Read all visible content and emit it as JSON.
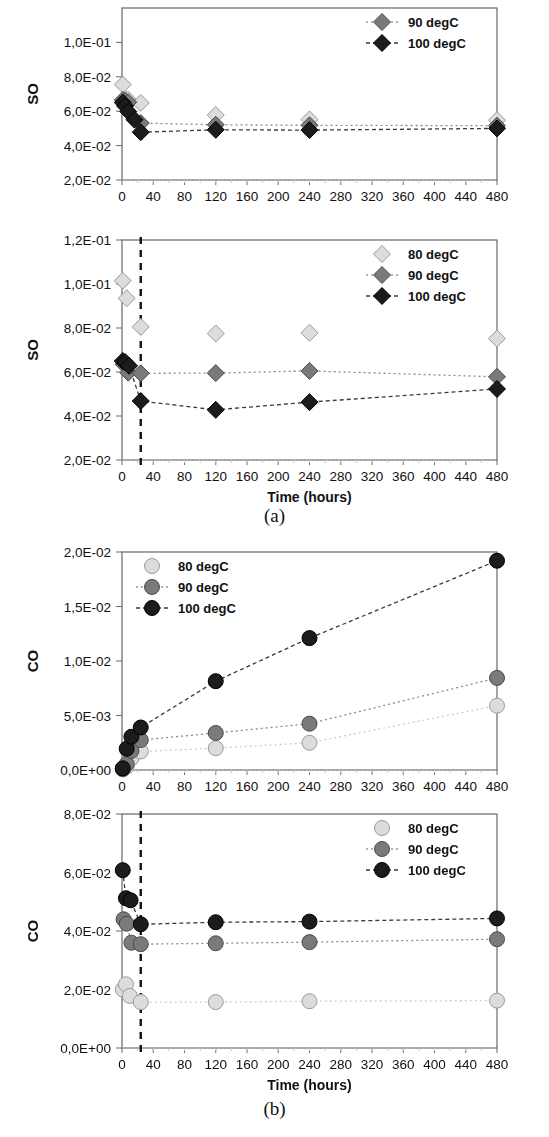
{
  "figure": {
    "captions": [
      {
        "id": "caption-a",
        "text": "(a)"
      },
      {
        "id": "caption-b",
        "text": "(b)"
      }
    ]
  },
  "legend_entries": [
    {
      "label": "80 degC",
      "marker": "light",
      "color": "#d9d9d9",
      "line": "none"
    },
    {
      "label": "90 degC",
      "marker": "mid",
      "color": "#7f7f7f",
      "line": "dotted"
    },
    {
      "label": "100 degC",
      "marker": "dark",
      "color": "#1a1a1a",
      "line": "dashed"
    }
  ],
  "axis": {
    "x_title": "Time (hours)",
    "x_ticks": [
      0,
      40,
      80,
      120,
      160,
      200,
      240,
      280,
      320,
      360,
      400,
      440,
      480
    ],
    "x_min": 0,
    "x_max": 480
  },
  "chart_data": [
    {
      "id": "chart-so-top",
      "type": "scatter",
      "title": "",
      "ylabel": "SO",
      "xlabel": "",
      "marker_shape": "diamond",
      "ylim": [
        0.02,
        0.12
      ],
      "ytick_values": [
        0.02,
        0.04,
        0.06,
        0.08,
        0.1
      ],
      "ytick_labels": [
        "2,0E-02",
        "4,0E-02",
        "6,0E-02",
        "8,0E-02",
        "1,0E-01"
      ],
      "ytop_label_clipped": true,
      "xlim": [
        0,
        480
      ],
      "xtick_labels": [
        "0",
        "40",
        "80",
        "120",
        "160",
        "200",
        "240",
        "280",
        "320",
        "360",
        "400",
        "440",
        "480"
      ],
      "grid": false,
      "legend_position": "top-right",
      "legend_visible": [
        "90 degC",
        "100 degC"
      ],
      "vline": null,
      "series": [
        {
          "name": "80 degC",
          "marker": "light",
          "line": "none",
          "x": [
            1,
            4,
            8,
            24,
            120,
            240,
            480
          ],
          "y": [
            0.0755,
            0.0672,
            0.0667,
            0.0648,
            0.0578,
            0.0552,
            0.0548
          ]
        },
        {
          "name": "90 degC",
          "marker": "mid",
          "line": "dotted",
          "x": [
            1,
            4,
            8,
            24,
            120,
            240,
            480
          ],
          "y": [
            0.0665,
            0.066,
            0.0652,
            0.0531,
            0.0521,
            0.0518,
            0.0516
          ]
        },
        {
          "name": "100 degC",
          "marker": "dark",
          "line": "dashed",
          "x": [
            1,
            4,
            8,
            16,
            24,
            120,
            240,
            480
          ],
          "y": [
            0.065,
            0.063,
            0.0598,
            0.0551,
            0.0478,
            0.0492,
            0.049,
            0.05
          ]
        }
      ]
    },
    {
      "id": "chart-so-bottom",
      "type": "scatter",
      "title": "",
      "ylabel": "SO",
      "xlabel": "Time (hours)",
      "marker_shape": "diamond",
      "ylim": [
        0.02,
        0.12
      ],
      "ytick_values": [
        0.02,
        0.04,
        0.06,
        0.08,
        0.1,
        0.12
      ],
      "ytick_labels": [
        "2,0E-02",
        "4,0E-02",
        "6,0E-02",
        "8,0E-02",
        "1,0E-01",
        "1,2E-01"
      ],
      "xlim": [
        0,
        480
      ],
      "xtick_labels": [
        "0",
        "40",
        "80",
        "120",
        "160",
        "200",
        "240",
        "280",
        "320",
        "360",
        "400",
        "440",
        "480"
      ],
      "grid": false,
      "legend_position": "top-right",
      "legend_visible": [
        "80 degC",
        "90 degC",
        "100 degC"
      ],
      "vline": {
        "x": 24,
        "style": "dashed",
        "color": "#111111"
      },
      "series": [
        {
          "name": "80 degC",
          "marker": "light",
          "line": "none",
          "x": [
            1,
            6,
            24,
            120,
            240,
            480
          ],
          "y": [
            0.1015,
            0.0935,
            0.0805,
            0.0775,
            0.0778,
            0.0752
          ]
        },
        {
          "name": "90 degC",
          "marker": "mid",
          "line": "dotted",
          "x": [
            2,
            8,
            24,
            120,
            240,
            480
          ],
          "y": [
            0.0635,
            0.0597,
            0.0594,
            0.0595,
            0.0605,
            0.0578
          ]
        },
        {
          "name": "100 degC",
          "marker": "dark",
          "line": "dashed",
          "x": [
            1,
            4,
            9,
            24,
            120,
            240,
            480
          ],
          "y": [
            0.065,
            0.0645,
            0.0628,
            0.0468,
            0.0428,
            0.0463,
            0.0523
          ]
        }
      ]
    },
    {
      "id": "chart-co-top",
      "type": "scatter",
      "title": "",
      "ylabel": "CO",
      "xlabel": "",
      "marker_shape": "circle",
      "ylim": [
        0.0,
        0.02
      ],
      "ytick_values": [
        0.0,
        0.005,
        0.01,
        0.015,
        0.02
      ],
      "ytick_labels": [
        "0,0E+00",
        "5,0E-03",
        "1,0E-02",
        "1,5E-02",
        "2,0E-02"
      ],
      "xlim": [
        0,
        480
      ],
      "xtick_labels": [
        "0",
        "40",
        "80",
        "120",
        "160",
        "200",
        "240",
        "280",
        "320",
        "360",
        "400",
        "440",
        "480"
      ],
      "grid": false,
      "legend_position": "top-left",
      "legend_visible": [
        "80 degC",
        "90 degC",
        "100 degC"
      ],
      "vline": null,
      "series": [
        {
          "name": "80 degC",
          "marker": "light",
          "line": "dotted",
          "x": [
            1,
            6,
            12,
            24,
            120,
            240,
            480
          ],
          "y": [
            5e-05,
            0.0003,
            0.00105,
            0.0017,
            0.002,
            0.0025,
            0.0059
          ]
        },
        {
          "name": "90 degC",
          "marker": "mid",
          "line": "dotted",
          "x": [
            1,
            6,
            12,
            24,
            120,
            240,
            480
          ],
          "y": [
            0.0001,
            0.00055,
            0.00175,
            0.00275,
            0.0034,
            0.00425,
            0.00845
          ]
        },
        {
          "name": "100 degC",
          "marker": "dark",
          "line": "dashed",
          "x": [
            1,
            6,
            12,
            24,
            120,
            240,
            480
          ],
          "y": [
            0.00015,
            0.00195,
            0.00305,
            0.0039,
            0.00815,
            0.0121,
            0.0192
          ]
        }
      ]
    },
    {
      "id": "chart-co-bottom",
      "type": "scatter",
      "title": "",
      "ylabel": "CO",
      "xlabel": "Time (hours)",
      "marker_shape": "circle",
      "ylim": [
        0.0,
        0.08
      ],
      "ytick_values": [
        0.0,
        0.02,
        0.04,
        0.06,
        0.08
      ],
      "ytick_labels": [
        "0,0E+00",
        "2,0E-02",
        "4,0E-02",
        "6,0E-02",
        "8,0E-02"
      ],
      "xlim": [
        0,
        480
      ],
      "xtick_labels": [
        "0",
        "40",
        "80",
        "120",
        "160",
        "200",
        "240",
        "280",
        "320",
        "360",
        "400",
        "440",
        "480"
      ],
      "grid": false,
      "legend_position": "top-right",
      "legend_visible": [
        "80 degC",
        "90 degC",
        "100 degC"
      ],
      "vline": {
        "x": 24,
        "style": "dashed",
        "color": "#111111"
      },
      "series": [
        {
          "name": "80 degC",
          "marker": "light",
          "line": "dotted",
          "x": [
            1,
            5,
            10,
            24,
            120,
            240,
            480
          ],
          "y": [
            0.02,
            0.0218,
            0.0178,
            0.0157,
            0.0157,
            0.016,
            0.0162
          ]
        },
        {
          "name": "90 degC",
          "marker": "mid",
          "line": "dotted",
          "x": [
            2,
            6,
            12,
            24,
            120,
            240,
            480
          ],
          "y": [
            0.044,
            0.0425,
            0.036,
            0.0355,
            0.0358,
            0.0362,
            0.0372
          ]
        },
        {
          "name": "100 degC",
          "marker": "dark",
          "line": "dashed",
          "x": [
            1,
            5,
            11,
            24,
            120,
            240,
            480
          ],
          "y": [
            0.0608,
            0.0512,
            0.0505,
            0.0423,
            0.043,
            0.0432,
            0.0443
          ]
        }
      ]
    }
  ]
}
